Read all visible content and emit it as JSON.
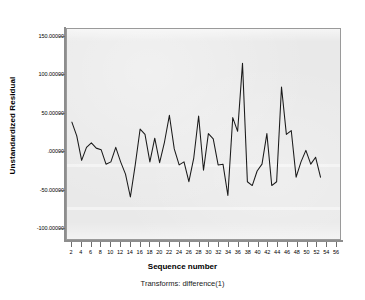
{
  "chart_data": {
    "type": "line",
    "title": "",
    "xlabel": "Sequence number",
    "ylabel": "Unstandardized Residual",
    "footnote": "Transforms:  difference(1)",
    "xlim": [
      1,
      57
    ],
    "ylim": [
      -115,
      160
    ],
    "grid": false,
    "legend": null,
    "line_color": "#1a1a1a",
    "plot_background": "#e9e9e9",
    "frame_color": "#9a9a9a",
    "y_ticks": [
      150,
      100,
      50,
      0,
      -50,
      -100
    ],
    "y_tick_labels": [
      "150.00000",
      "100.00000",
      "50.00000",
      ".00000",
      "-50.00000",
      "-100.00000"
    ],
    "x_ticks": [
      2,
      4,
      6,
      8,
      10,
      12,
      14,
      16,
      18,
      20,
      22,
      24,
      26,
      28,
      30,
      32,
      34,
      36,
      38,
      40,
      42,
      44,
      46,
      48,
      50,
      52,
      54,
      56
    ],
    "x": [
      2,
      3,
      4,
      5,
      6,
      7,
      8,
      9,
      10,
      11,
      12,
      13,
      14,
      15,
      16,
      17,
      18,
      19,
      20,
      21,
      22,
      23,
      24,
      25,
      26,
      27,
      28,
      29,
      30,
      31,
      32,
      33,
      34,
      35,
      36,
      37,
      38,
      39,
      40,
      41,
      42,
      43,
      44,
      45,
      46,
      47,
      48,
      49,
      50,
      51,
      52,
      53
    ],
    "values": [
      38,
      20,
      -12,
      5,
      11,
      4,
      2,
      -17,
      -14,
      5,
      -14,
      -30,
      -60,
      -18,
      29,
      22,
      -14,
      17,
      -15,
      12,
      47,
      3,
      -18,
      -14,
      -40,
      -9,
      46,
      -25,
      23,
      16,
      -18,
      -17,
      -58,
      44,
      26,
      115,
      -40,
      -45,
      -26,
      -17,
      23,
      -45,
      -40,
      84,
      22,
      27,
      -34,
      -14,
      1,
      -17,
      -8,
      -34
    ]
  },
  "axes": {
    "y_title": "Unstandardized Residual",
    "x_title": "Sequence number"
  }
}
